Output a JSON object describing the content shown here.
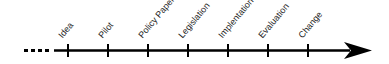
{
  "diagram": {
    "type": "timeline",
    "stages": [
      {
        "label": "Idea",
        "x": 68
      },
      {
        "label": "Pilot",
        "x": 108
      },
      {
        "label": "Policy Paper",
        "x": 148
      },
      {
        "label": "Legislation",
        "x": 188
      },
      {
        "label": "Implentation",
        "x": 228
      },
      {
        "label": "Evaluation",
        "x": 268
      },
      {
        "label": "Change",
        "x": 308
      }
    ],
    "line_color": "#000000"
  }
}
